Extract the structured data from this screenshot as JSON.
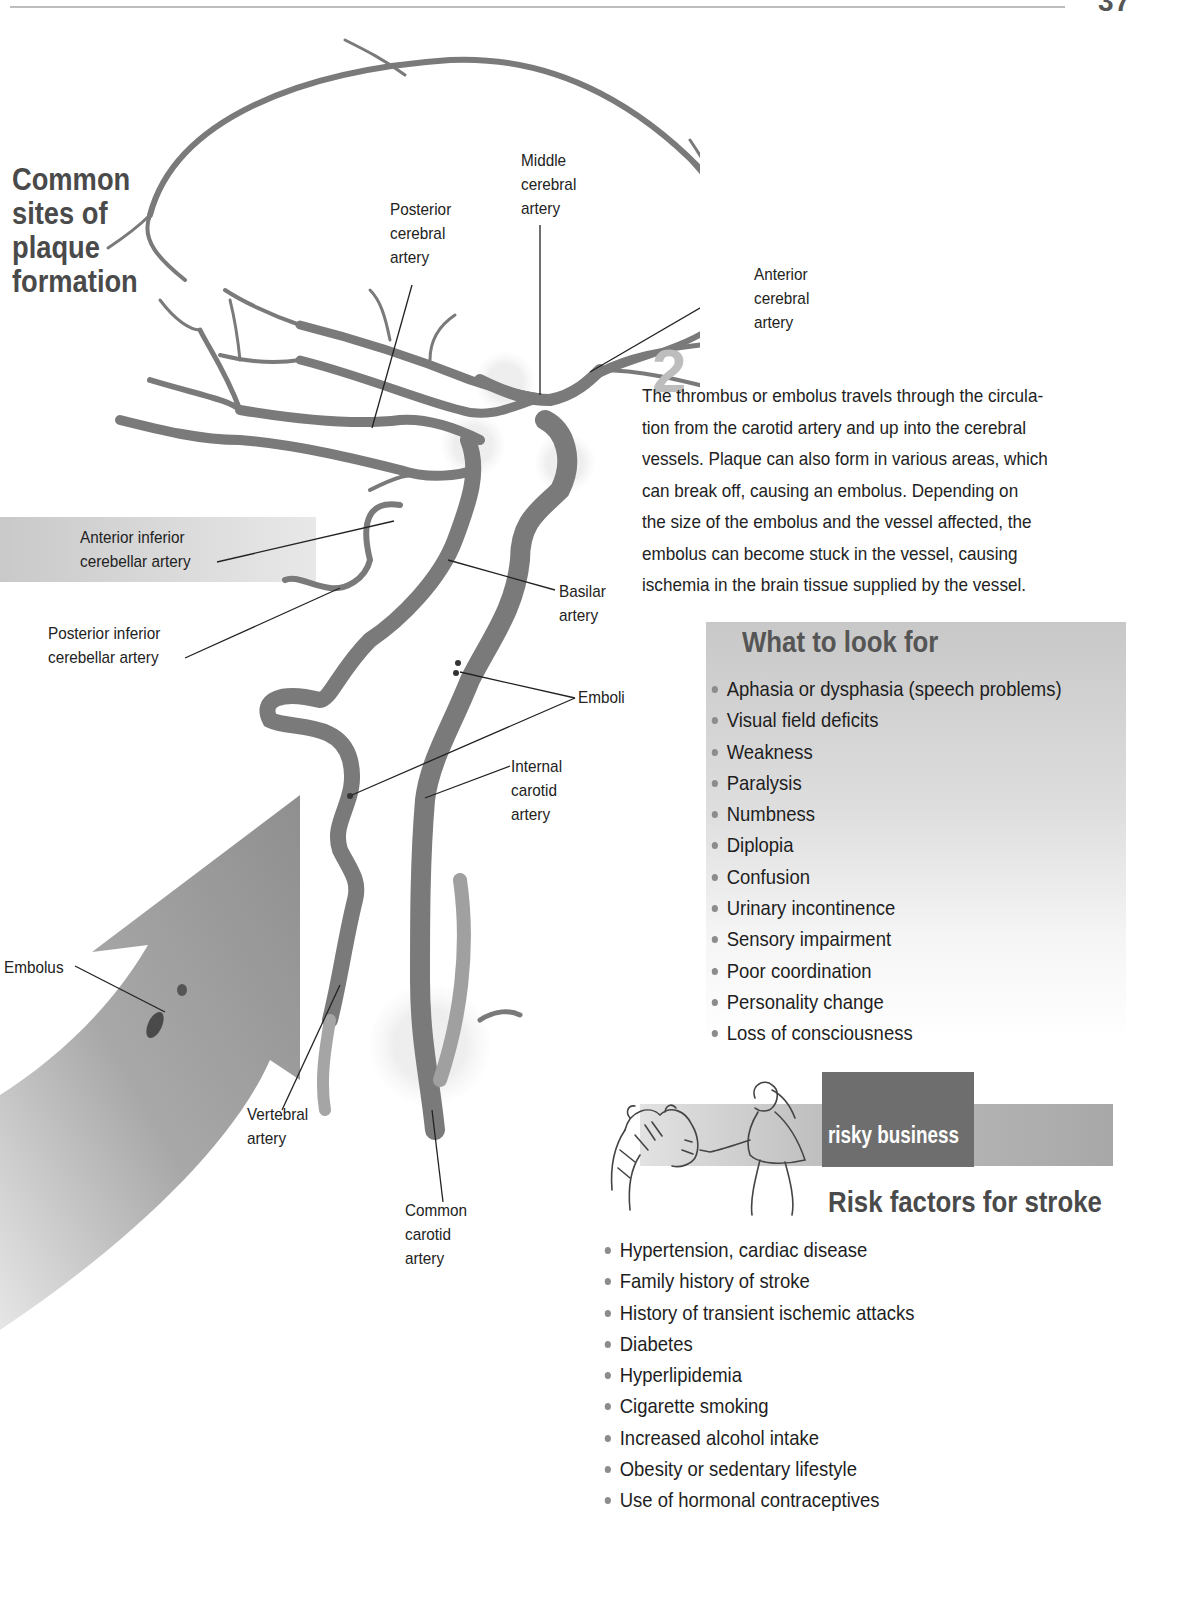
{
  "page": {
    "number": "37"
  },
  "diagram": {
    "title": [
      "Common",
      "sites of",
      "plaque",
      "formation"
    ],
    "step_marker": "2",
    "labels": {
      "middle_cerebral": [
        "Middle",
        "cerebral",
        "artery"
      ],
      "posterior_cerebral": [
        "Posterior",
        "cerebral",
        "artery"
      ],
      "anterior_cerebral": [
        "Anterior",
        "cerebral",
        "artery"
      ],
      "anterior_inferior_cerebellar": [
        "Anterior inferior",
        "cerebellar artery"
      ],
      "posterior_inferior_cerebellar": [
        "Posterior inferior",
        "cerebellar artery"
      ],
      "basilar": [
        "Basilar",
        "artery"
      ],
      "emboli": "Emboli",
      "internal_carotid": [
        "Internal",
        "carotid",
        "artery"
      ],
      "embolus": "Embolus",
      "vertebral": [
        "Vertebral",
        "artery"
      ],
      "common_carotid": [
        "Common",
        "carotid",
        "artery"
      ]
    }
  },
  "body_text": {
    "lines": [
      "The thrombus or embolus travels through the circula-",
      "tion from the carotid artery and up into the cerebral",
      "vessels. Plaque can also form in various areas, which",
      "can break off, causing an embolus. Depending on",
      "the size of the embolus and the vessel affected, the",
      "embolus can become stuck in the vessel, causing",
      "ischemia in the brain tissue supplied by the vessel."
    ]
  },
  "what_to_look_for": {
    "title": "What to look for",
    "items": [
      "Aphasia or dysphasia (speech problems)",
      "Visual field deficits",
      "Weakness",
      "Paralysis",
      "Numbness",
      "Diplopia",
      "Confusion",
      "Urinary incontinence",
      "Sensory impairment",
      "Poor coordination",
      "Personality change",
      "Loss of consciousness"
    ]
  },
  "risky_business": {
    "tab_label": "risky business",
    "title": "Risk factors for stroke",
    "items": [
      "Hypertension, cardiac disease",
      "Family history of stroke",
      "History of transient ischemic attacks",
      "Diabetes",
      "Hyperlipidemia",
      "Cigarette smoking",
      "Increased alcohol intake",
      "Obesity or sedentary lifestyle",
      "Use of hormonal contraceptives"
    ]
  },
  "colors": {
    "artery": "#7a7a7a",
    "arrow": "#9a9a9a",
    "box_gray": "#c8c8c8",
    "tab_dark": "#6e6e6e",
    "title_gray": "#4a4a4a"
  }
}
